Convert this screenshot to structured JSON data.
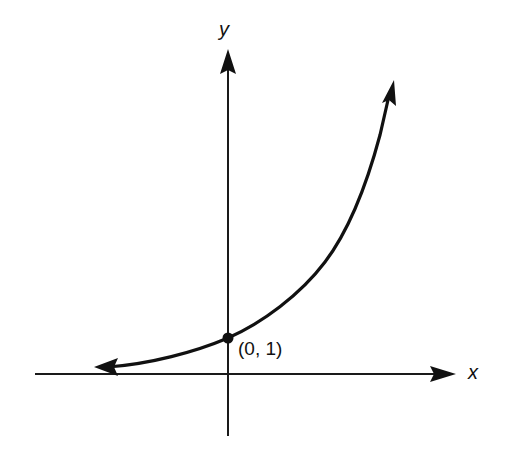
{
  "diagram": {
    "title": "",
    "axes": {
      "x_label": "x",
      "y_label": "y"
    },
    "curve": {
      "description": "Increasing exponential curve y = a^x (a > 1), with arrows at both ends",
      "left_end": "approaches x-axis asymptotically (arrow pointing left)",
      "right_end": "rises steeply (arrow pointing up-right)"
    },
    "marked_point": {
      "label": "(0, 1)",
      "x": 0,
      "y": 1
    },
    "colors": {
      "ink": "#111111",
      "background": "#ffffff"
    }
  }
}
